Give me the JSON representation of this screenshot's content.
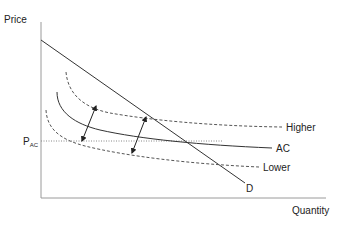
{
  "diagram": {
    "y_axis_label": "Price",
    "x_axis_label": "Quantity",
    "price_level_label": "P",
    "price_level_subscript": "AC",
    "curves": {
      "demand": "D",
      "average_cost": "AC",
      "higher": "Higher",
      "lower": "Lower"
    },
    "arrows": [
      {
        "name": "left-shift-arrow",
        "direction": "bidirectional"
      },
      {
        "name": "right-shift-arrow",
        "direction": "bidirectional"
      }
    ]
  }
}
